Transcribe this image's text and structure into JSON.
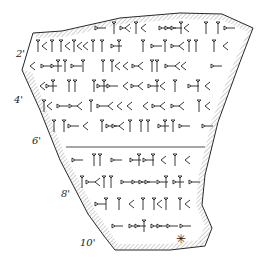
{
  "figure": {
    "line_numbers": [
      {
        "label": "2'",
        "x": 16,
        "y": 48
      },
      {
        "label": "4'",
        "x": 14,
        "y": 94
      },
      {
        "label": "6'",
        "x": 32,
        "y": 135
      },
      {
        "label": "8'",
        "x": 61,
        "y": 188
      },
      {
        "label": "10'",
        "x": 80,
        "y": 237
      }
    ],
    "marker": {
      "symbol": "✳",
      "x": 176,
      "y": 232
    },
    "colors": {
      "ink": "#222222",
      "hatch": "#888888",
      "background": "#ffffff"
    }
  },
  "rows": [
    {
      "y": 28,
      "x1": 95,
      "x2": 235
    },
    {
      "y": 46,
      "x1": 36,
      "x2": 232
    },
    {
      "y": 66,
      "x1": 30,
      "x2": 225
    },
    {
      "y": 86,
      "x1": 40,
      "x2": 220
    },
    {
      "y": 106,
      "x1": 42,
      "x2": 215
    },
    {
      "y": 126,
      "x1": 52,
      "x2": 210
    },
    {
      "y": 160,
      "x1": 72,
      "x2": 205
    },
    {
      "y": 182,
      "x1": 80,
      "x2": 200
    },
    {
      "y": 204,
      "x1": 95,
      "x2": 200
    },
    {
      "y": 226,
      "x1": 112,
      "x2": 200
    }
  ]
}
